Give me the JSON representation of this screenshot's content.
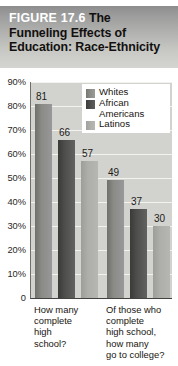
{
  "figure": {
    "label": "FIGURE 17.6",
    "title_line1_rest": "The",
    "title_line2": "Funneling Effects of",
    "title_line3": "Education: Race-Ethnicity"
  },
  "colors": {
    "whites": "#8a8a86",
    "african_americans": "#4e4e4c",
    "latinos": "#adada9",
    "plot_background": "#d2d2ce",
    "gridline": "#f2f2ef",
    "header_top": "#8d8d8d",
    "header_bottom": "#d4d4d1"
  },
  "chart_data": {
    "type": "bar",
    "title": "FIGURE 17.6 The Funneling Effects of Education: Race-Ethnicity",
    "xlabel": "",
    "ylabel": "",
    "ylim": [
      0,
      90
    ],
    "grid": true,
    "legend_position": "top-right",
    "ytick_labels": [
      "90%",
      "80%",
      "70%",
      "60%",
      "50%",
      "40%",
      "30%",
      "20%",
      "10%",
      "0"
    ],
    "ytick_values": [
      90,
      80,
      70,
      60,
      50,
      40,
      30,
      20,
      10,
      0
    ],
    "categories": [
      "How many complete high school?",
      "Of those who complete high school, how many go to college?"
    ],
    "category_labels_wrapped": [
      "How many\ncomplete\nhigh\nschool?",
      "Of those who\ncomplete\nhigh school,\nhow many\ngo to college?"
    ],
    "series": [
      {
        "name": "Whites",
        "values": [
          81,
          57
        ]
      },
      {
        "name": "African Americans",
        "values": [
          66,
          37
        ]
      },
      {
        "name": "Latinos",
        "values": [
          57,
          30
        ]
      }
    ],
    "bars": [
      {
        "group": 0,
        "series": "Whites",
        "value": 81,
        "label": "81"
      },
      {
        "group": 0,
        "series": "African Americans",
        "value": 66,
        "label": "66"
      },
      {
        "group": 0,
        "series": "Latinos",
        "value": 57,
        "label": "57"
      },
      {
        "group": 1,
        "series": "Whites",
        "value": 49,
        "label": "49"
      },
      {
        "group": 1,
        "series": "African Americans",
        "value": 37,
        "label": "37"
      },
      {
        "group": 1,
        "series": "Latinos",
        "value": 30,
        "label": "30"
      }
    ]
  },
  "legend": {
    "entries": [
      {
        "label": "Whites"
      },
      {
        "label": "African\nAmericans"
      },
      {
        "label": "Latinos"
      }
    ]
  }
}
